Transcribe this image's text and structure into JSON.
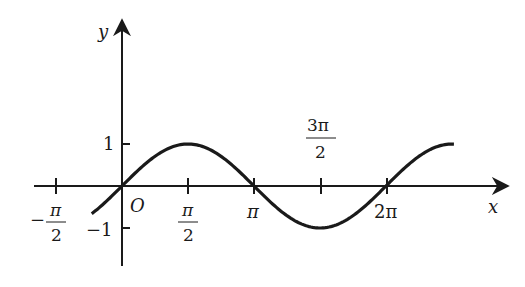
{
  "chart_data": {
    "type": "line",
    "title": "",
    "function": "y = sin x",
    "xlabel": "x",
    "ylabel": "y",
    "origin_label": "O",
    "x_range_plotted": [
      -0.72,
      7.9
    ],
    "y_range": [
      -1,
      1
    ],
    "grid": false,
    "legend": null,
    "x_ticks": [
      {
        "value": -1.5708,
        "label": "-π/2",
        "num": "π",
        "den": "2",
        "sign": "−"
      },
      {
        "value": 1.5708,
        "label": "π/2",
        "num": "π",
        "den": "2"
      },
      {
        "value": 3.1416,
        "label": "π"
      },
      {
        "value": 4.7124,
        "label": "3π/2",
        "num": "3π",
        "den": "2"
      },
      {
        "value": 6.2832,
        "label": "2π"
      }
    ],
    "y_ticks": [
      {
        "value": 1,
        "label": "1"
      },
      {
        "value": -1,
        "label": "−1"
      }
    ],
    "series": [
      {
        "name": "sin x",
        "x": [
          -0.72,
          0,
          0.785,
          1.5708,
          2.356,
          3.1416,
          3.927,
          4.7124,
          5.498,
          6.2832,
          7.069,
          7.9
        ],
        "values": [
          -0.66,
          0,
          0.707,
          1,
          0.707,
          0,
          -0.707,
          -1,
          -0.707,
          0,
          0.707,
          1
        ]
      }
    ],
    "colors": {
      "curve": "#1a1a1a",
      "axes": "#1a1a1a"
    }
  }
}
